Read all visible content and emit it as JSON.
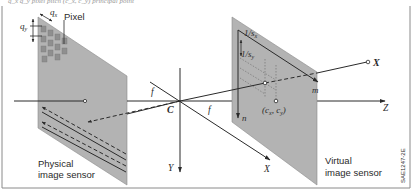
{
  "figure": {
    "type": "pinhole camera model diagram",
    "top_caption_cut": "q_x q_y  pixel pitch  (c_x, c_y)  principal point",
    "labels": {
      "pixel": "Pixel",
      "qx": "q",
      "qx_sub": "x",
      "qy": "q",
      "qy_sub": "y",
      "f_left": "f",
      "f_right": "f",
      "center": "C",
      "axis_y": "Y",
      "axis_x": "X",
      "axis_z": "Z",
      "world_point": "X",
      "one_over_sx": "1/s",
      "one_over_sx_sub": "x",
      "one_over_sy": "1/s",
      "one_over_sy_sub": "y",
      "axis_m": "m",
      "axis_n": "n",
      "principal_point": "(c",
      "principal_point_sub_x": "x",
      "principal_point_mid": ", c",
      "principal_point_sub_y": "y",
      "principal_point_end": ")",
      "physical_sensor_line1": "Physical",
      "physical_sensor_line2": "image sensor",
      "virtual_sensor_line1": "Virtual",
      "virtual_sensor_line2": "image sensor",
      "figure_id": "SAE1247-2E"
    },
    "colors": {
      "sensor_fill": "#b3b3b3",
      "pixel_fill": "#8f8f8f",
      "line": "#2a2a2a",
      "frame": "#8a8a8a"
    }
  }
}
